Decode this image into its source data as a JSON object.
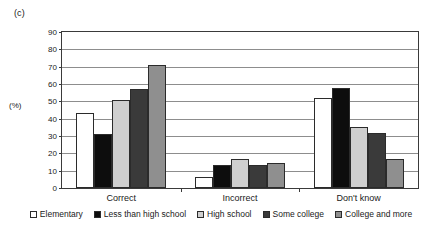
{
  "figure": {
    "panel_label": "(c)",
    "y_axis_title": "(%)"
  },
  "chart_data": {
    "type": "bar",
    "title": "",
    "subtitle": "",
    "xlabel": "",
    "ylabel": "(%)",
    "ylim": [
      0,
      90
    ],
    "ytick_step": 10,
    "yticks": [
      90,
      80,
      70,
      60,
      50,
      40,
      30,
      20,
      10,
      0
    ],
    "ytick_labels": [
      "90",
      "80",
      "70",
      "60",
      "50",
      "40",
      "30",
      "20",
      "10",
      "0"
    ],
    "grid": true,
    "grid_axis": "y",
    "legend_position": "bottom",
    "categories": [
      "Correct",
      "Incorrect",
      "Don't know"
    ],
    "series": [
      {
        "name": "Elementary",
        "color": "#ffffff",
        "values": [
          43,
          6.5,
          52
        ]
      },
      {
        "name": "Less than high school",
        "color": "#0d0d0d",
        "values": [
          31,
          13,
          57.5
        ]
      },
      {
        "name": "High school",
        "color": "#cfcfcf",
        "values": [
          51,
          17,
          35
        ]
      },
      {
        "name": "Some college",
        "color": "#3a3a3a",
        "values": [
          57,
          13,
          31.5
        ]
      },
      {
        "name": "College and more",
        "color": "#8f8f8f",
        "values": [
          71,
          14.5,
          16.5
        ]
      }
    ]
  }
}
